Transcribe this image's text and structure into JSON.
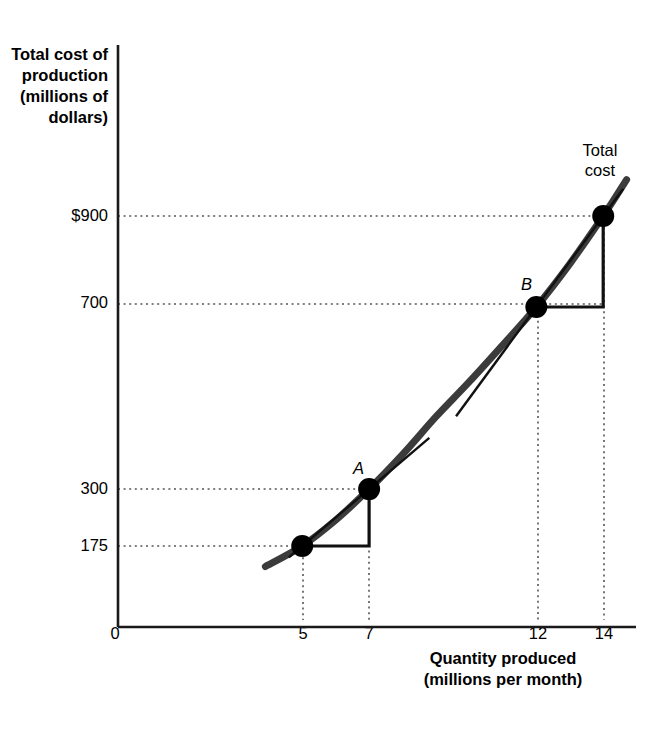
{
  "chart_data": {
    "type": "line",
    "title": "",
    "xlabel": "Quantity produced\n(millions per month)",
    "ylabel": "Total cost of\nproduction\n(millions of\ndollars)",
    "series_label": "Total\ncost",
    "xlim": [
      0,
      15.5
    ],
    "ylim": [
      0,
      1060
    ],
    "grid": "dotted-guides-only",
    "legend": "inline-curve-label",
    "x_ticks": [
      {
        "value": 0,
        "label": "0"
      },
      {
        "value": 5,
        "label": "5"
      },
      {
        "value": 7,
        "label": "7"
      },
      {
        "value": 12,
        "label": "12"
      },
      {
        "value": 14,
        "label": "14"
      }
    ],
    "y_ticks": [
      {
        "value": 900,
        "label": "$900"
      },
      {
        "value": 700,
        "label": "700"
      },
      {
        "value": 300,
        "label": "300"
      },
      {
        "value": 175,
        "label": "175"
      }
    ],
    "curve_points": [
      {
        "x": 3.9,
        "y": 130
      },
      {
        "x": 5.0,
        "y": 175
      },
      {
        "x": 6.0,
        "y": 232
      },
      {
        "x": 7.0,
        "y": 300
      },
      {
        "x": 8.0,
        "y": 376
      },
      {
        "x": 9.0,
        "y": 459
      },
      {
        "x": 10.0,
        "y": 536
      },
      {
        "x": 11.0,
        "y": 617
      },
      {
        "x": 12.0,
        "y": 700
      },
      {
        "x": 13.0,
        "y": 795
      },
      {
        "x": 14.0,
        "y": 900
      },
      {
        "x": 14.7,
        "y": 980
      }
    ],
    "marked_points": [
      {
        "label": "",
        "x": 5,
        "y": 175
      },
      {
        "label": "A",
        "x": 7,
        "y": 300
      },
      {
        "label": "B",
        "x": 12,
        "y": 700
      },
      {
        "label": "",
        "x": 14,
        "y": 900
      }
    ],
    "slope_triangles": [
      {
        "name": "triangle-a",
        "from": {
          "x": 5,
          "y": 175
        },
        "to": {
          "x": 7,
          "y": 300
        },
        "run": 2,
        "rise": 125
      },
      {
        "name": "triangle-b",
        "from": {
          "x": 12,
          "y": 700
        },
        "to": {
          "x": 14,
          "y": 900
        },
        "run": 2,
        "rise": 200
      }
    ],
    "tangent_lines": [
      {
        "name": "tangent-at-a",
        "through": {
          "x": 7,
          "y": 300
        },
        "x_start": 4.6,
        "x_end": 8.8
      },
      {
        "name": "tangent-at-b",
        "through": {
          "x": 12,
          "y": 700
        },
        "x_start": 9.6,
        "x_end": 14.6
      }
    ],
    "guide_lines_y": [
      175,
      300,
      700,
      900
    ],
    "guide_lines_x": [
      5,
      7,
      12,
      14
    ],
    "colors": {
      "curve": "#3b3b3b",
      "axis": "#1a1a1a",
      "text": "#000000",
      "guide": "#555555",
      "marker": "#000000"
    }
  }
}
